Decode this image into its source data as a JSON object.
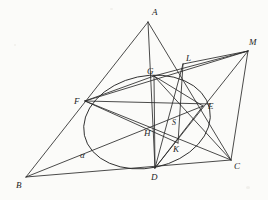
{
  "figure": {
    "kind": "euclidean-geometry-diagram",
    "background_color": "#fbfbf9",
    "ink_color": "#2b2b2b",
    "width": 268,
    "height": 200,
    "conic_label": "α",
    "points": [
      {
        "id": "A",
        "label": "A",
        "x": 148,
        "y": 22,
        "label_x": 152,
        "label_y": 15
      },
      {
        "id": "B",
        "label": "B",
        "x": 26,
        "y": 177,
        "label_x": 16,
        "label_y": 188
      },
      {
        "id": "C",
        "label": "C",
        "x": 231,
        "y": 160,
        "label_x": 234,
        "label_y": 169
      },
      {
        "id": "D",
        "label": "D",
        "x": 155,
        "y": 168,
        "label_x": 151,
        "label_y": 180
      },
      {
        "id": "E",
        "label": "E",
        "x": 203,
        "y": 106,
        "label_x": 208,
        "label_y": 109
      },
      {
        "id": "F",
        "label": "F",
        "x": 85,
        "y": 101,
        "label_x": 74,
        "label_y": 104
      },
      {
        "id": "G",
        "label": "G",
        "x": 154,
        "y": 76,
        "label_x": 147,
        "label_y": 74
      },
      {
        "id": "H",
        "label": "H",
        "x": 155,
        "y": 131,
        "label_x": 144,
        "label_y": 136
      },
      {
        "id": "K",
        "label": "K",
        "x": 178,
        "y": 143,
        "label_x": 173,
        "label_y": 152
      },
      {
        "id": "L",
        "label": "L",
        "x": 183,
        "y": 64,
        "label_x": 186,
        "label_y": 61
      },
      {
        "id": "M",
        "label": "M",
        "x": 248,
        "y": 51,
        "label_x": 249,
        "label_y": 45
      },
      {
        "id": "S",
        "label": "S",
        "x": 177,
        "y": 115,
        "label_x": 172,
        "label_y": 125
      }
    ],
    "conic": {
      "label": "α",
      "label_x": 80,
      "label_y": 158,
      "center_x": 147,
      "center_y": 122,
      "radius_x": 64,
      "radius_y": 46,
      "rotation_deg": -12
    },
    "segments": [
      {
        "name": "side-AB",
        "from": "A",
        "to": "B"
      },
      {
        "name": "side-AC",
        "from": "A",
        "to": "C"
      },
      {
        "name": "side-BC",
        "from": "B",
        "to": "C"
      },
      {
        "name": "cevian-AD",
        "from": "A",
        "to": "D"
      },
      {
        "name": "cevian-BE",
        "from": "B",
        "to": "E"
      },
      {
        "name": "cevian-CF",
        "from": "C",
        "to": "F"
      },
      {
        "name": "chord-FE",
        "from": "F",
        "to": "E"
      },
      {
        "name": "chord-FG",
        "from": "F",
        "to": "G"
      },
      {
        "name": "chord-FK",
        "from": "F",
        "to": "K"
      },
      {
        "name": "chord-FC",
        "from": "F",
        "to": "C"
      },
      {
        "name": "chord-GD",
        "from": "G",
        "to": "D"
      },
      {
        "name": "chord-GC",
        "from": "G",
        "to": "C"
      },
      {
        "name": "chord-GE",
        "from": "G",
        "to": "E"
      },
      {
        "name": "chord-DE",
        "from": "D",
        "to": "E"
      },
      {
        "name": "chord-DL",
        "from": "D",
        "to": "L"
      },
      {
        "name": "chord-DM",
        "from": "D",
        "to": "M"
      },
      {
        "name": "line-LM",
        "from": "L",
        "to": "M"
      },
      {
        "name": "line-FM",
        "from": "F",
        "to": "M"
      },
      {
        "name": "line-CM",
        "from": "C",
        "to": "M"
      },
      {
        "name": "line-LK",
        "from": "L",
        "to": "K"
      },
      {
        "name": "line-GM",
        "from": "G",
        "to": "M"
      }
    ]
  }
}
